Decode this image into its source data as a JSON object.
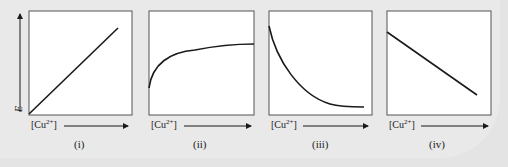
{
  "figure": {
    "y_axis_label": "E",
    "x_axis_label_prefix": "[Cu",
    "x_axis_label_sup": "2+",
    "x_axis_label_suffix": "]",
    "panels": [
      {
        "id": "i",
        "caption": "(i)",
        "curve": "linear increasing from origin"
      },
      {
        "id": "ii",
        "caption": "(ii)",
        "curve": "logarithmic increasing, flattening"
      },
      {
        "id": "iii",
        "caption": "(iii)",
        "curve": "exponential decay to plateau"
      },
      {
        "id": "iv",
        "caption": "(iv)",
        "curve": "linear decreasing"
      }
    ]
  },
  "colors": {
    "background": "#e4e4e4",
    "panel_fill": "#ffffff",
    "line": "#1a1a1a"
  }
}
